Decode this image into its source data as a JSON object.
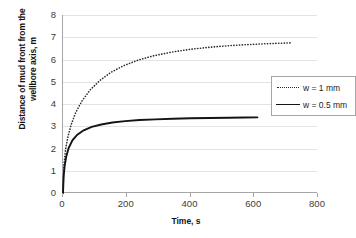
{
  "chart_data": {
    "type": "line",
    "title": "",
    "xlabel": "Time, s",
    "ylabel": "Distance of mud front from the wellbore axis, m",
    "ylabel_line1": "Distance of mud front from the",
    "ylabel_line2": "wellbore axis, m",
    "xlim": [
      0,
      800
    ],
    "ylim": [
      0,
      8
    ],
    "xticks": [
      0,
      200,
      400,
      600,
      800
    ],
    "yticks": [
      0,
      1,
      2,
      3,
      4,
      5,
      6,
      7,
      8
    ],
    "grid": "horizontal",
    "legend_position": "center-right",
    "legend": [
      "w = 1 mm",
      "w = 0.5 mm"
    ],
    "series": [
      {
        "name": "w = 1 mm",
        "style": "dotted",
        "color": "#2b2b2b",
        "x": [
          0,
          3,
          8,
          15,
          25,
          40,
          60,
          85,
          115,
          150,
          190,
          235,
          285,
          340,
          400,
          460,
          520,
          580,
          640,
          700,
          720
        ],
        "y": [
          0,
          1.3,
          1.95,
          2.5,
          3.05,
          3.62,
          4.15,
          4.63,
          5.05,
          5.42,
          5.72,
          5.97,
          6.17,
          6.33,
          6.46,
          6.55,
          6.62,
          6.67,
          6.71,
          6.74,
          6.75
        ]
      },
      {
        "name": "w = 0.5 mm",
        "style": "solid",
        "color": "#141414",
        "x": [
          0,
          2,
          5,
          10,
          18,
          30,
          45,
          65,
          90,
          120,
          155,
          195,
          240,
          290,
          345,
          400,
          460,
          520,
          570,
          610
        ],
        "y": [
          0,
          0.75,
          1.2,
          1.63,
          2.03,
          2.38,
          2.62,
          2.82,
          2.97,
          3.08,
          3.17,
          3.23,
          3.28,
          3.31,
          3.34,
          3.36,
          3.37,
          3.385,
          3.39,
          3.4
        ]
      }
    ]
  },
  "axis": {
    "x_tick_labels": [
      "0",
      "200",
      "400",
      "600",
      "800"
    ],
    "y_tick_labels": [
      "0",
      "1",
      "2",
      "3",
      "4",
      "5",
      "6",
      "7",
      "8"
    ]
  },
  "colors": {
    "grid": "#e3e3e3",
    "axis": "#a6a6a6",
    "series1": "#2b2b2b",
    "series2": "#141414",
    "text": "#3b3b3b"
  }
}
